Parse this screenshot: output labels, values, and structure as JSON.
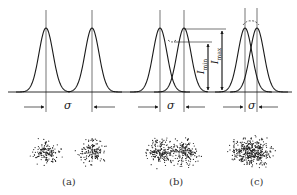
{
  "figure": {
    "panels": [
      {
        "id": "a",
        "label": "(a)",
        "sigma_label": "σ",
        "state": "well resolved",
        "peak_separation_px": 46
      },
      {
        "id": "b",
        "label": "(b)",
        "sigma_label": "σ",
        "state": "just resolved",
        "peak_separation_px": 24
      },
      {
        "id": "c",
        "label": "(c)",
        "sigma_label": "σ",
        "state": "unresolved",
        "peak_separation_px": 12
      }
    ],
    "annotations": {
      "i_min": {
        "symbol": "I",
        "subscript": "min"
      },
      "i_max": {
        "symbol": "I",
        "subscript": "max"
      }
    },
    "colors": {
      "line": "#1a1a1a",
      "dots": "#222222",
      "background": "#ffffff"
    }
  }
}
